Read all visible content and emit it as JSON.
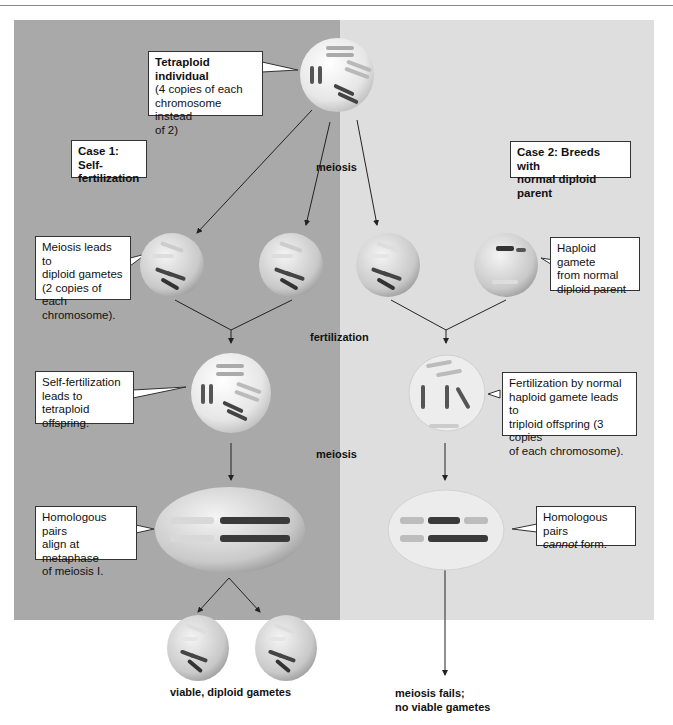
{
  "colors": {
    "left_panel": "#a9a9a9",
    "right_panel": "#dedede",
    "callout_bg": "#ffffff",
    "line": "#222222"
  },
  "headers": {
    "case1": "Case 1: Self-fertilization",
    "case1_line1": "Case 1: Self-",
    "case1_line2": "fertilization",
    "case2_line1": "Case 2: Breeds with",
    "case2_line2": "normal diploid parent"
  },
  "callouts": {
    "tetraploid": {
      "title": "Tetraploid individual",
      "l1": "(4 copies of each",
      "l2": "chromosome instead",
      "l3": "of 2)"
    },
    "diploid_gametes": {
      "l1": "Meiosis leads to",
      "l2": "diploid gametes",
      "l3": "(2 copies of each",
      "l4": "chromosome)."
    },
    "haploid_gamete": {
      "l1": "Haploid gamete",
      "l2": "from normal",
      "l3": "diploid parent"
    },
    "self_fert": {
      "l1": "Self-fertilization",
      "l2": "leads to tetraploid",
      "l3": "offspring."
    },
    "triploid": {
      "l1": "Fertilization by normal",
      "l2": "haploid gamete leads to",
      "l3": "triploid offspring (3 copies",
      "l4": "of each chromosome)."
    },
    "homologous_align": {
      "l1": "Homologous pairs",
      "l2": "align at metaphase",
      "l3": "of meiosis I."
    },
    "homologous_fail": {
      "l1": "Homologous pairs",
      "l2_italic": "cannot",
      "l2_rest": " form."
    }
  },
  "process_labels": {
    "meiosis_top": "meiosis",
    "fertilization": "fertilization",
    "meiosis_mid": "meiosis"
  },
  "outcomes": {
    "left": "viable, diploid gametes",
    "right_l1": "meiosis fails;",
    "right_l2": "no viable gametes"
  }
}
